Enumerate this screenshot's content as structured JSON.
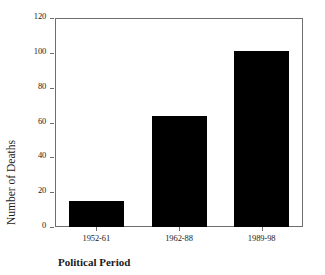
{
  "chart_data": {
    "type": "bar",
    "title": "",
    "xlabel": "Political Period",
    "ylabel": "Number of Deaths",
    "categories": [
      "1952-61",
      "1962-88",
      "1989-98"
    ],
    "values": [
      15,
      64,
      101
    ],
    "series": [
      {
        "name": "Number of Deaths",
        "values": [
          15,
          64,
          101
        ]
      }
    ],
    "ylim": [
      0,
      120
    ],
    "yticks": [
      0,
      20,
      40,
      60,
      80,
      100,
      120
    ],
    "ytick_labels": [
      "0",
      "20",
      "40",
      "60",
      "80",
      "100",
      "120"
    ],
    "grid": false,
    "legend": false,
    "legend_position": "none",
    "bar_color": "#000000",
    "frame_color": "#6e6e6e",
    "background": "#ffffff"
  }
}
